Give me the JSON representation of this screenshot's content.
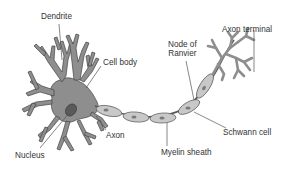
{
  "diagram": {
    "colors": {
      "cell_fill": "#8e8e8e",
      "cell_stroke": "#444444",
      "nucleus_fill": "#5a5a5a",
      "myelin_fill": "#c8c8c8",
      "myelin_nucleus": "#7a7a7a",
      "leader_line": "#555555",
      "label_text": "#333333",
      "background": "#ffffff"
    },
    "labels": {
      "dendrite": "Dendrite",
      "cell_body": "Cell body",
      "nucleus": "Nucleus",
      "axon": "Axon",
      "node_of_ranvier_line1": "Node of",
      "node_of_ranvier_line2": "Ranvier",
      "axon_terminal": "Axon terminal",
      "schwann_cell": "Schwann cell",
      "myelin_sheath": "Myelin sheath"
    },
    "parts": [
      "dendrite",
      "cell-body",
      "nucleus",
      "axon",
      "myelin-sheath",
      "schwann-cell",
      "node-of-ranvier",
      "axon-terminal"
    ]
  }
}
